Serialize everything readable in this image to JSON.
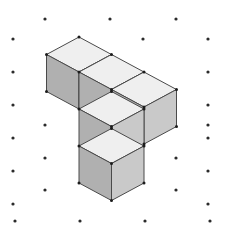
{
  "scene": {
    "title": "Isometric Unit-Cube Assembly",
    "width": 226,
    "height": 229,
    "background_color": "#ffffff",
    "description": "Five unit cubes drawn in isometric projection on a staggered dot grid: a horizontal row of three cubes with a two-cube column descending from beneath the left-middle of the row.",
    "cube_count": 5
  },
  "palette": {
    "top_face_color": "#efefef",
    "left_face_color": "#b0b0b0",
    "right_face_color": "#c9c9c9",
    "edge_color": "#4a4a4a",
    "vertex_color": "#1c1c1c",
    "dot_color": "#2b2b2b",
    "background_color": "#ffffff"
  },
  "projection": {
    "origin_x": 79,
    "origin_y": 37,
    "unit_dx": 32.5,
    "unit_dy": 17.5,
    "unit_height": 37,
    "note": "Isometric axes: +u goes right-down, +v goes left-down, +h goes straight down."
  },
  "dot_grid": {
    "label": "isometric-dot-grid",
    "column_spacing": 65,
    "row_spacing": 33,
    "stagger_offset": 32.5,
    "points": [
      [
        45,
        19
      ],
      [
        110,
        19
      ],
      [
        176,
        19
      ],
      [
        13,
        39
      ],
      [
        143,
        39
      ],
      [
        208,
        39
      ],
      [
        13,
        72
      ],
      [
        78,
        72
      ],
      [
        208,
        72
      ],
      [
        13,
        105
      ],
      [
        143,
        105
      ],
      [
        208,
        105
      ],
      [
        45,
        125
      ],
      [
        208,
        125
      ],
      [
        13,
        138
      ],
      [
        208,
        138
      ],
      [
        45,
        158
      ],
      [
        176,
        158
      ],
      [
        13,
        171
      ],
      [
        208,
        171
      ],
      [
        45,
        190
      ],
      [
        176,
        190
      ],
      [
        13,
        204
      ],
      [
        208,
        204
      ],
      [
        15,
        221
      ],
      [
        80,
        221
      ],
      [
        145,
        221
      ],
      [
        210,
        221
      ]
    ]
  },
  "cubes": [
    {
      "name": "row-cube-left",
      "u": 0,
      "v": 0,
      "h": 0
    },
    {
      "name": "row-cube-middle",
      "u": 1,
      "v": 0,
      "h": 0
    },
    {
      "name": "row-cube-right",
      "u": 2,
      "v": 0,
      "h": 0
    },
    {
      "name": "column-cube-upper",
      "u": 1,
      "v": 0,
      "h": 1
    },
    {
      "name": "column-cube-lower",
      "u": 1,
      "v": 0,
      "h": 2
    }
  ],
  "faces": {
    "top_label": "top-face",
    "left_label": "left-face",
    "right_label": "right-face"
  }
}
